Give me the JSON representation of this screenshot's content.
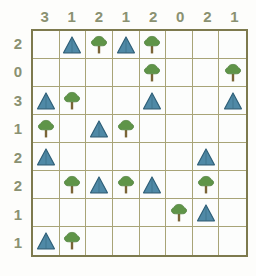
{
  "puzzle": {
    "type": "tents-and-trees",
    "size": 8,
    "column_clues": [
      3,
      1,
      2,
      1,
      2,
      0,
      2,
      1
    ],
    "row_clues": [
      2,
      0,
      3,
      1,
      2,
      2,
      1,
      1
    ],
    "glyph_names": {
      "tent": "tent-icon",
      "tree": "tree-icon",
      "empty": "empty-cell"
    },
    "colors": {
      "tent_fill": "#4f89a6",
      "tent_outline": "#2e5f78",
      "tree_canopy": "#5f9448",
      "tree_trunk": "#7a6436",
      "grid_line": "#a8a477",
      "grid_border": "#7d7a4e",
      "clue_text": "#8a9171",
      "background": "#fdfdfb"
    },
    "cells": [
      [
        "empty",
        "tent",
        "tree",
        "tent",
        "tree",
        "empty",
        "empty",
        "empty"
      ],
      [
        "empty",
        "empty",
        "empty",
        "empty",
        "tree",
        "empty",
        "empty",
        "tree"
      ],
      [
        "tent",
        "tree",
        "empty",
        "empty",
        "tent",
        "empty",
        "empty",
        "tent"
      ],
      [
        "tree",
        "empty",
        "tent",
        "tree",
        "empty",
        "empty",
        "empty",
        "empty"
      ],
      [
        "tent",
        "empty",
        "empty",
        "empty",
        "empty",
        "empty",
        "tent",
        "empty"
      ],
      [
        "empty",
        "tree",
        "tent",
        "tree",
        "tent",
        "empty",
        "tree",
        "empty"
      ],
      [
        "empty",
        "empty",
        "empty",
        "empty",
        "empty",
        "tree",
        "tent",
        "empty"
      ],
      [
        "tent",
        "tree",
        "empty",
        "empty",
        "empty",
        "empty",
        "empty",
        "empty"
      ]
    ]
  }
}
